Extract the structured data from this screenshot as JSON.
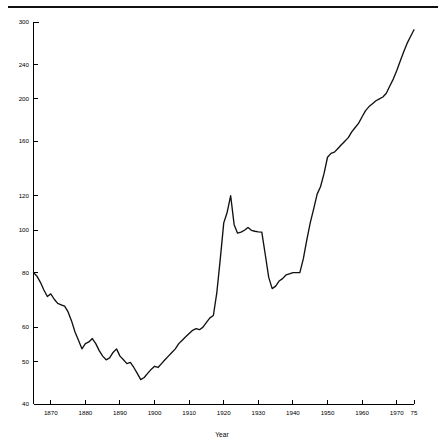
{
  "figure": {
    "has_top_rule": true,
    "background_color": "#ffffff",
    "line_color": "#111111"
  },
  "chart_data": {
    "type": "line",
    "title": "",
    "subtitle": "",
    "xlabel": "Year",
    "ylabel": "",
    "grid": false,
    "legend": null,
    "xscale": "linear",
    "yscale": "log",
    "xlim": [
      1865,
      1975
    ],
    "ylim": [
      40,
      300
    ],
    "xticks": [
      1870,
      1880,
      1890,
      1900,
      1910,
      1920,
      1930,
      1940,
      1950,
      1960,
      1970,
      1975
    ],
    "xtick_labels": [
      "1870",
      "1880",
      "1890",
      "1900",
      "1910",
      "1920",
      "1930",
      "1940",
      "1950",
      "1960",
      "1970",
      "75"
    ],
    "yticks": [
      40,
      50,
      60,
      80,
      100,
      120,
      160,
      200,
      240,
      300
    ],
    "ytick_labels": [
      "40",
      "50",
      "60",
      "80",
      "100",
      "120",
      "160",
      "200",
      "240",
      "300"
    ],
    "series": [
      {
        "name": "series-1",
        "x": [
          1865,
          1866,
          1867,
          1868,
          1869,
          1870,
          1871,
          1872,
          1873,
          1874,
          1875,
          1876,
          1877,
          1878,
          1879,
          1880,
          1881,
          1882,
          1883,
          1884,
          1885,
          1886,
          1887,
          1888,
          1889,
          1890,
          1891,
          1892,
          1893,
          1894,
          1895,
          1896,
          1897,
          1898,
          1899,
          1900,
          1901,
          1902,
          1903,
          1904,
          1905,
          1906,
          1907,
          1908,
          1909,
          1910,
          1911,
          1912,
          1913,
          1914,
          1915,
          1916,
          1917,
          1918,
          1919,
          1920,
          1921,
          1922,
          1923,
          1924,
          1925,
          1926,
          1927,
          1928,
          1929,
          1930,
          1931,
          1932,
          1933,
          1934,
          1935,
          1936,
          1937,
          1938,
          1939,
          1940,
          1941,
          1942,
          1943,
          1944,
          1945,
          1946,
          1947,
          1948,
          1949,
          1950,
          1951,
          1952,
          1953,
          1954,
          1955,
          1956,
          1957,
          1958,
          1959,
          1960,
          1961,
          1962,
          1963,
          1964,
          1965,
          1966,
          1967,
          1968,
          1969,
          1970,
          1971,
          1972,
          1973,
          1974,
          1975
        ],
        "values": [
          80.0,
          78.5,
          76.0,
          73.0,
          70.5,
          71.5,
          69.5,
          68.0,
          67.5,
          67.0,
          65.0,
          62.0,
          58.5,
          56.0,
          53.5,
          55.0,
          55.5,
          56.5,
          55.0,
          53.0,
          51.5,
          50.5,
          51.0,
          52.5,
          53.5,
          51.5,
          50.5,
          49.5,
          49.8,
          48.5,
          47.0,
          45.5,
          46.0,
          47.0,
          48.0,
          48.8,
          48.5,
          49.5,
          50.5,
          51.5,
          52.5,
          53.5,
          55.0,
          56.0,
          57.0,
          58.0,
          59.0,
          59.5,
          59.2,
          60.0,
          61.5,
          63.0,
          63.8,
          72.0,
          86.0,
          104.0,
          110.0,
          120.0,
          103.0,
          98.5,
          99.0,
          100.0,
          101.5,
          100.0,
          99.5,
          99.2,
          99.0,
          88.0,
          78.0,
          73.5,
          74.5,
          76.5,
          77.5,
          79.0,
          79.5,
          80.0,
          80.0,
          80.0,
          86.0,
          95.0,
          104.0,
          112.0,
          121.0,
          126.0,
          135.0,
          147.0,
          150.0,
          151.0,
          154.0,
          157.0,
          160.0,
          163.0,
          168.0,
          172.0,
          176.0,
          182.0,
          188.0,
          192.0,
          195.0,
          198.0,
          200.0,
          202.0,
          206.0,
          214.0,
          222.0,
          232.0,
          244.0,
          256.0,
          268.0,
          278.0,
          288.0
        ]
      }
    ]
  }
}
